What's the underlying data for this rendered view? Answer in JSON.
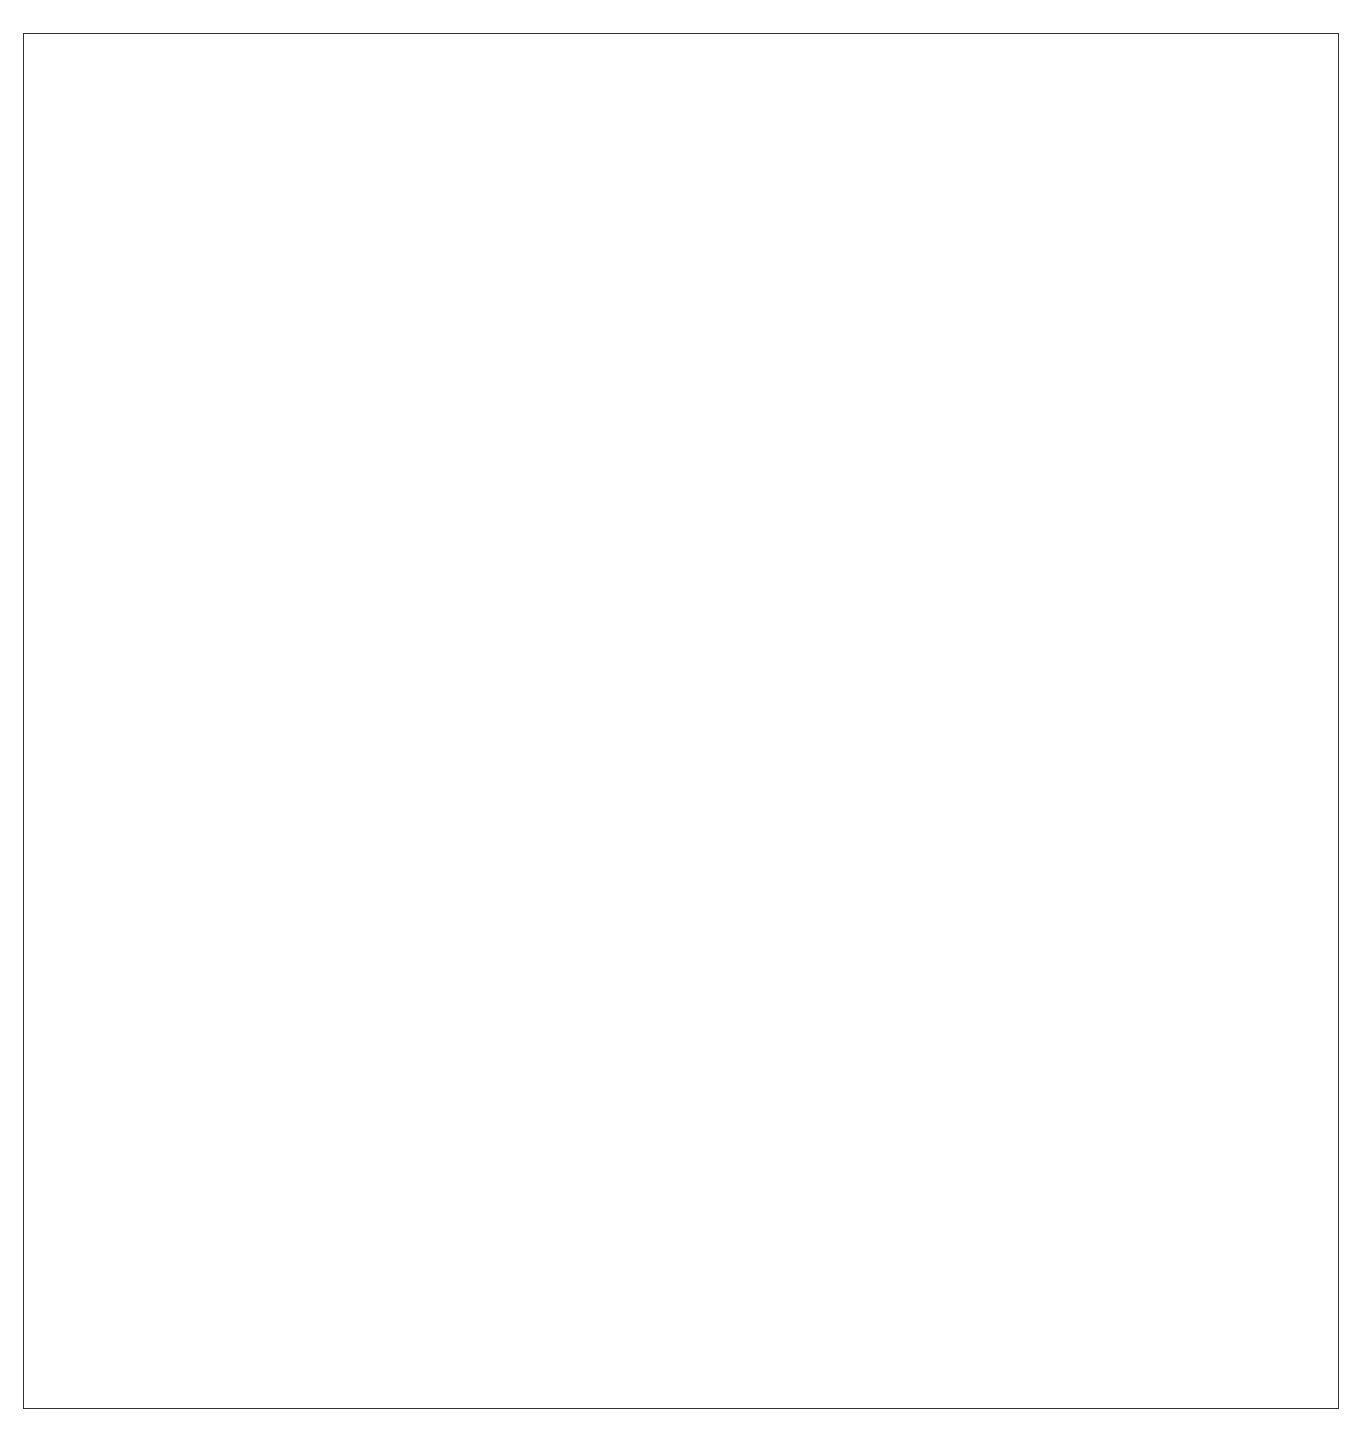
{
  "figure": {
    "panels": [
      {
        "id": "A",
        "label": "A",
        "type": "horizontal-stripes",
        "stripe_color": "#aaaaaa",
        "stripe_count": 14,
        "stripes": [
          {
            "y": 72,
            "h": 25
          },
          {
            "y": 117,
            "h": 19
          },
          {
            "y": 157,
            "h": 19
          },
          {
            "y": 198,
            "h": 19
          },
          {
            "y": 238,
            "h": 19
          },
          {
            "y": 280,
            "h": 20
          },
          {
            "y": 318,
            "h": 20
          },
          {
            "y": 363,
            "h": 20
          },
          {
            "y": 400,
            "h": 20
          },
          {
            "y": 442,
            "h": 20
          },
          {
            "y": 483,
            "h": 20
          },
          {
            "y": 525,
            "h": 20
          },
          {
            "y": 566,
            "h": 20
          },
          {
            "y": 608,
            "h": 20
          }
        ]
      },
      {
        "id": "B",
        "label": "B",
        "type": "vertical-stripes",
        "stripe_color": "#333333",
        "stripe_count": 16,
        "stripes": [
          694,
          733,
          773,
          815,
          855,
          893,
          933,
          972,
          1013,
          1053,
          1093,
          1133,
          1173,
          1214,
          1254,
          1296
        ]
      },
      {
        "id": "C",
        "label": "C",
        "type": "maze-pattern",
        "stripe_color": "#111111"
      }
    ]
  }
}
